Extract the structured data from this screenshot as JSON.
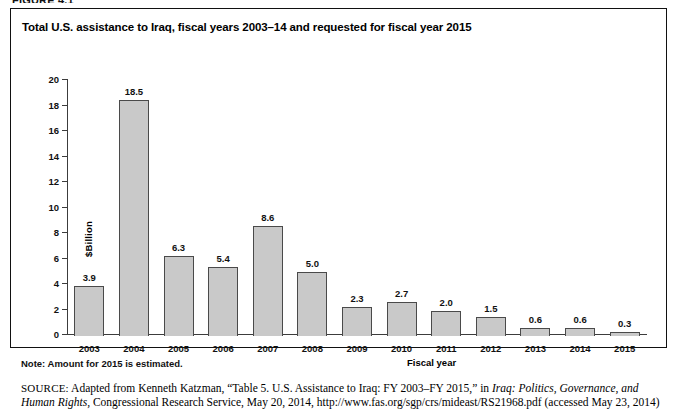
{
  "figure_caption": "FIGURE 4.1",
  "figure": {
    "title": "Total U.S. assistance to Iraq, fiscal years 2003–14 and requested for fiscal year 2015",
    "note": "Note: Amount for 2015 is estimated.",
    "source": {
      "label": "SOURCE:",
      "text_before_italic": " Adapted from Kenneth Katzman, “Table 5. U.S. Assistance to Iraq: FY 2003–FY 2015,” in ",
      "italic_title": "Iraq: Politics, Governance, and Human Rights,",
      "text_after_italic": " Congressional Research Service, May 20, 2014, http://www.fas.org/sgp/crs/mideast/RS21968.pdf (accessed May 23, 2014)"
    }
  },
  "chart_data": {
    "type": "bar",
    "title": "Total U.S. assistance to Iraq, fiscal years 2003–14 and requested for fiscal year 2015",
    "xlabel": "Fiscal year",
    "ylabel": "$Billion",
    "categories": [
      "2003",
      "2004",
      "2005",
      "2006",
      "2007",
      "2008",
      "2009",
      "2010",
      "2011",
      "2012",
      "2013",
      "2014",
      "2015"
    ],
    "values": [
      3.9,
      18.5,
      6.3,
      5.4,
      8.6,
      5.0,
      2.3,
      2.7,
      2.0,
      1.5,
      0.6,
      0.6,
      0.3
    ],
    "value_labels": [
      "3.9",
      "18.5",
      "6.3",
      "5.4",
      "8.6",
      "5.0",
      "2.3",
      "2.7",
      "2.0",
      "1.5",
      "0.6",
      "0.6",
      "0.3"
    ],
    "ylim": [
      0,
      20
    ],
    "yticks": [
      0,
      2,
      4,
      6,
      8,
      10,
      12,
      14,
      16,
      18,
      20
    ],
    "ytick_labels": [
      "0",
      "2",
      "4",
      "6",
      "8",
      "10",
      "12",
      "14",
      "16",
      "18",
      "20"
    ],
    "grid": false,
    "legend": "none",
    "bar_fill_color": "#c9c9c9",
    "bar_edge_color": "#4a4a4a",
    "axis_color": "#3c3c3c"
  }
}
